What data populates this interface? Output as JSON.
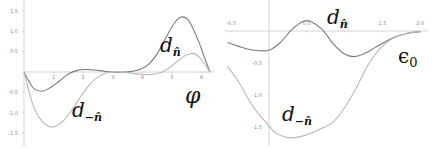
{
  "chart_data": [
    {
      "type": "line",
      "title": "",
      "xlabel": "φ",
      "ylabel": "",
      "xlim": [
        0,
        6.2832
      ],
      "ylim": [
        -1.5,
        1.5
      ],
      "x_ticks": [
        "1",
        "2",
        "3",
        "4",
        "5",
        "6"
      ],
      "y_ticks": [
        "1.5",
        "1.0",
        "0.5",
        "-0.5",
        "-1.0",
        "-1.5"
      ],
      "grid": false,
      "series": [
        {
          "name": "d_n̂",
          "label": "d",
          "sub": "n̂",
          "color": "#7a7a7a",
          "x": [
            0,
            0.3,
            0.6,
            0.9,
            1.2,
            1.5,
            1.8,
            2.1,
            2.4,
            2.7,
            3.0,
            3.3,
            3.6,
            3.9,
            4.2,
            4.5,
            4.8,
            5.1,
            5.35,
            5.6,
            5.9,
            6.1,
            6.2832
          ],
          "y": [
            0,
            -0.38,
            -0.47,
            -0.38,
            -0.22,
            -0.05,
            0.04,
            0.06,
            0.05,
            0.02,
            0.0,
            -0.01,
            0.01,
            0.06,
            0.18,
            0.45,
            0.85,
            1.22,
            1.35,
            1.22,
            0.75,
            0.35,
            0
          ]
        },
        {
          "name": "d_-n̂",
          "label": "d",
          "sub": "−n̂",
          "color": "#b8b8b8",
          "x": [
            0,
            0.3,
            0.6,
            0.95,
            1.3,
            1.6,
            1.9,
            2.2,
            2.5,
            2.8,
            3.1,
            3.4,
            3.7,
            4.0,
            4.3,
            4.6,
            4.9,
            5.2,
            5.5,
            5.75,
            6.0,
            6.2832
          ],
          "y": [
            0,
            -0.8,
            -1.2,
            -1.35,
            -1.22,
            -0.95,
            -0.62,
            -0.32,
            -0.12,
            -0.02,
            0.0,
            -0.01,
            -0.04,
            -0.06,
            -0.06,
            -0.02,
            0.1,
            0.27,
            0.42,
            0.45,
            0.3,
            0
          ]
        }
      ]
    },
    {
      "type": "line",
      "title": "",
      "xlabel": "ϵ0",
      "ylabel": "",
      "xlim": [
        -0.5,
        2.0
      ],
      "ylim": [
        -1.75,
        0.2
      ],
      "x_ticks": [
        "-0.5",
        "0.5",
        "1.0",
        "1.5",
        "2.0"
      ],
      "y_ticks": [
        "-0.5",
        "-1.0",
        "-1.5"
      ],
      "grid": false,
      "series": [
        {
          "name": "d_n̂",
          "label": "d",
          "sub": "n̂",
          "color": "#7a7a7a",
          "x": [
            -0.55,
            -0.4,
            -0.2,
            0.0,
            0.15,
            0.3,
            0.45,
            0.55,
            0.7,
            0.85,
            1.0,
            1.12,
            1.25,
            1.4,
            1.55,
            1.7,
            1.85,
            2.0
          ],
          "y": [
            -0.18,
            -0.24,
            -0.3,
            -0.3,
            -0.18,
            0.02,
            0.15,
            0.15,
            0.03,
            -0.2,
            -0.36,
            -0.4,
            -0.36,
            -0.26,
            -0.16,
            -0.08,
            -0.03,
            -0.01
          ]
        },
        {
          "name": "d_-n̂",
          "label": "d",
          "sub": "−n̂",
          "color": "#b8b8b8",
          "x": [
            -0.55,
            -0.4,
            -0.2,
            0.0,
            0.1,
            0.3,
            0.5,
            0.7,
            0.85,
            1.0,
            1.15,
            1.3,
            1.45,
            1.6,
            1.75,
            1.9,
            2.0
          ],
          "y": [
            -0.55,
            -0.8,
            -1.2,
            -1.48,
            -1.6,
            -1.67,
            -1.62,
            -1.52,
            -1.42,
            -1.2,
            -0.9,
            -0.55,
            -0.3,
            -0.14,
            -0.06,
            -0.02,
            -0.01
          ]
        }
      ]
    }
  ]
}
